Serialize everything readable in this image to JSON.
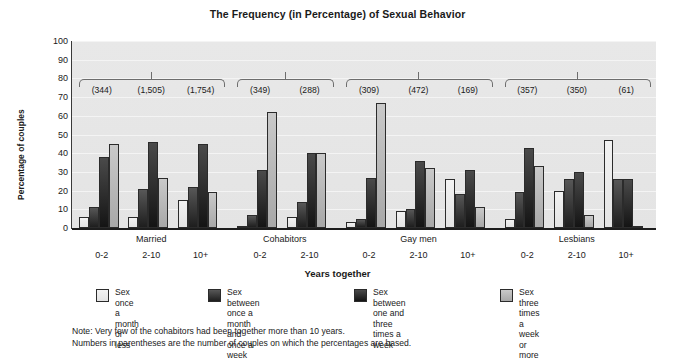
{
  "chart_data": {
    "type": "bar",
    "title": "The Frequency (in Percentage) of Sexual Behavior",
    "xlabel": "Years together",
    "ylabel": "Percentage of couples",
    "ylim": [
      0,
      100
    ],
    "ytick_labels": [
      "0",
      "10",
      "20",
      "30",
      "40",
      "50",
      "60",
      "70",
      "80",
      "90",
      "100"
    ],
    "grid": true,
    "legend_position": "bottom",
    "categories": [
      "0-2",
      "2-10",
      "10+",
      "0-2",
      "2-10",
      "0-2",
      "2-10",
      "10+",
      "0-2",
      "2-10",
      "10+"
    ],
    "group_labels": [
      "Married",
      "Cohabitors",
      "Gay men",
      "Lesbians"
    ],
    "group_sizes": [
      3,
      2,
      3,
      3
    ],
    "sample_sizes": [
      "(344)",
      "(1,505)",
      "(1,754)",
      "(349)",
      "(288)",
      "(309)",
      "(472)",
      "(169)",
      "(357)",
      "(350)",
      "(61)"
    ],
    "series": [
      {
        "name": "Sex once a month or less",
        "color": "#f0f0f0",
        "values": [
          6,
          6,
          15,
          1,
          6,
          3,
          9,
          26,
          5,
          20,
          47
        ]
      },
      {
        "name": "Sex between once a month and once a week",
        "color": "#2a2a2a",
        "values": [
          11,
          21,
          22,
          7,
          14,
          5,
          10,
          18,
          19,
          26,
          26
        ]
      },
      {
        "name": "Sex between one and three times a week",
        "color": "#1c1c1c",
        "values": [
          38,
          46,
          45,
          31,
          40,
          27,
          36,
          31,
          43,
          30,
          26
        ]
      },
      {
        "name": "Sex three times a week or more",
        "color": "#b8b8b8",
        "values": [
          45,
          27,
          19,
          62,
          40,
          67,
          32,
          11,
          33,
          7,
          1
        ]
      }
    ],
    "footnotes": [
      "Note: Very few of the cohabitors had been together more than 10 years.",
      "Numbers in parentheses are the number of couples on which the percentages are based."
    ]
  }
}
